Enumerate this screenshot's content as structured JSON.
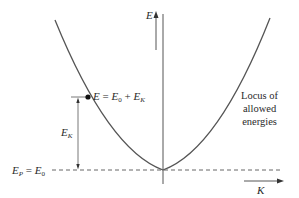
{
  "diagram": {
    "axes": {
      "vertical_label": "E",
      "horizontal_label": "K"
    },
    "point_label": {
      "lhs": "E",
      "eq": " = ",
      "e0_base": "E",
      "e0_sub": "0",
      "plus": " + ",
      "ek_base": "E",
      "ek_sub": "K"
    },
    "ek_label": {
      "base": "E",
      "sub": "K"
    },
    "baseline_label": {
      "ep_base": "E",
      "ep_sub": "P",
      "eq": " = ",
      "e0_base": "E",
      "e0_sub": "0"
    },
    "locus_label": [
      "Locus of",
      "allowed",
      "energies"
    ],
    "colors": {
      "line": "#555555",
      "text": "#2a2a2a",
      "point": "#111111"
    }
  }
}
